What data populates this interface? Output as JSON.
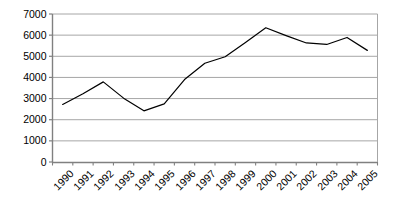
{
  "chart_data": {
    "type": "line",
    "title": "",
    "subtitle": "",
    "xlabel": "",
    "ylabel": "",
    "categories": [
      "1990",
      "1991",
      "1992",
      "1993",
      "1994",
      "1995",
      "1996",
      "1997",
      "1998",
      "1999",
      "2000",
      "2001",
      "2002",
      "2003",
      "2004",
      "2005"
    ],
    "values": [
      2720,
      3230,
      3790,
      3020,
      2420,
      2750,
      3900,
      4670,
      4980,
      5650,
      6350,
      5980,
      5630,
      5560,
      5890,
      5280
    ],
    "series": [
      {
        "name": "series-1",
        "values": [
          2720,
          3230,
          3790,
          3020,
          2420,
          2750,
          3900,
          4670,
          4980,
          5650,
          6350,
          5980,
          5630,
          5560,
          5890,
          5280
        ]
      }
    ],
    "ylim": [
      0,
      7000
    ],
    "ytick_labels": [
      "0",
      "1000",
      "2000",
      "3000",
      "4000",
      "5000",
      "6000",
      "7000"
    ],
    "ytick_values": [
      0,
      1000,
      2000,
      3000,
      4000,
      5000,
      6000,
      7000
    ],
    "grid": true,
    "grid_axis": "y",
    "legend": false,
    "legend_position": "none",
    "annotations": [],
    "colors": {
      "line": "#000000",
      "grid": "#a6a6a6",
      "axis": "#808080",
      "background": "#ffffff",
      "text": "#000000"
    }
  }
}
